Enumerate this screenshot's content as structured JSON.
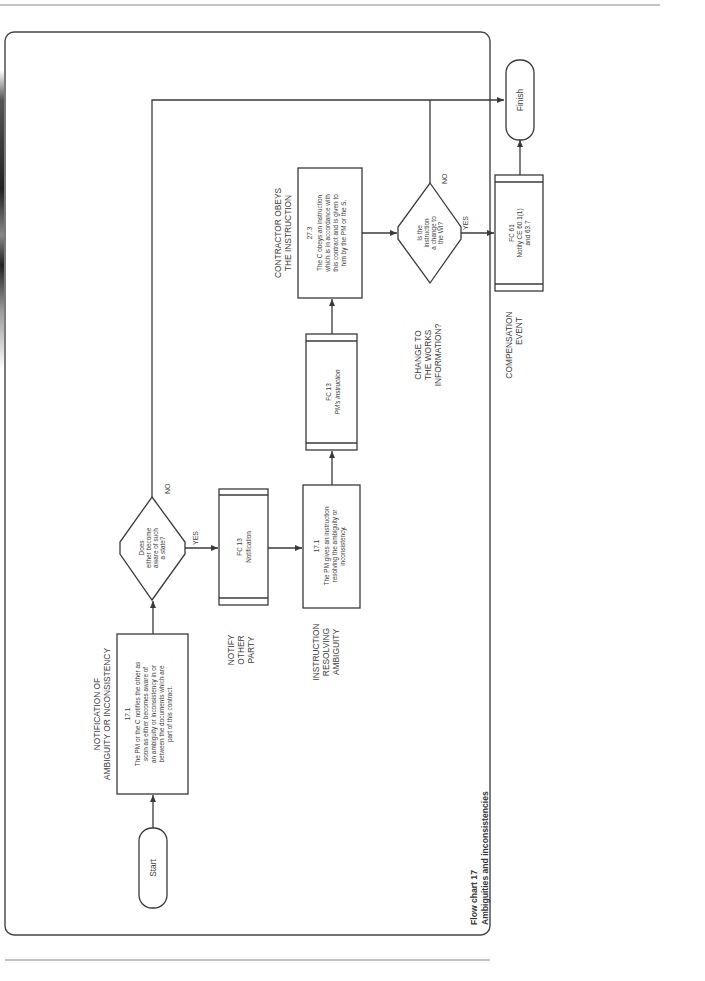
{
  "caption": {
    "line1": "Flow chart 17",
    "line2": "Ambiguities and inconsistencies"
  },
  "terminators": {
    "start": "Start",
    "finish": "Finish"
  },
  "stages": {
    "notification": [
      "NOTIFICATION OF",
      "AMBIGUITY OR INCONSISTENCY"
    ],
    "notify_other": [
      "NOTIFY",
      "OTHER",
      "PARTY"
    ],
    "instruction_resolving": [
      "INSTRUCTION",
      "RESOLVING",
      "AMBIGUITY"
    ],
    "contractor_obeys": [
      "CONTRACTOR OBEYS",
      "THE INSTRUCTION"
    ],
    "change_works": [
      "CHANGE TO",
      "THE WORKS",
      "INFORMATION?"
    ],
    "compensation": [
      "COMPENSATION",
      "EVENT"
    ]
  },
  "boxes": {
    "clause_17_1_notify": {
      "ref": "17.1",
      "lines": [
        "The PM or the C notifies the other as",
        "soon as either becomes aware of",
        "an ambiguity or inconsistency in or",
        "between the documents which are",
        "part of this contract."
      ]
    },
    "fc13_notification": {
      "ref": "FC 13",
      "lines": [
        "Notification"
      ]
    },
    "clause_17_1_instruction": {
      "ref": "17.1",
      "lines": [
        "The PM gives an instruction",
        "resolving the ambiguity or",
        "inconsistency."
      ]
    },
    "fc13_pm_instruction": {
      "ref": "FC 13",
      "lines": [
        "PM's instruction"
      ]
    },
    "clause_27_3": {
      "ref": "27.3",
      "lines": [
        "The C obeys an instruction",
        "which is in accordance with",
        "this contract and is given to",
        "him by the PM or the S."
      ]
    },
    "fc61": {
      "ref": "FC 61",
      "lines": [
        "Notify CE 60.1(1)",
        "and 63.7"
      ]
    }
  },
  "decisions": {
    "aware": {
      "lines": [
        "Does",
        "either become",
        "aware of such",
        "a state?"
      ],
      "yes": "YES",
      "no": "NO"
    },
    "change_wi": {
      "lines": [
        "Is the",
        "instruction",
        "a change to",
        "the WI?"
      ],
      "yes": "YES",
      "no": "NO"
    }
  },
  "colors": {
    "line": "#3a3a3a",
    "text": "#3c3c3c",
    "background": "#ffffff"
  }
}
